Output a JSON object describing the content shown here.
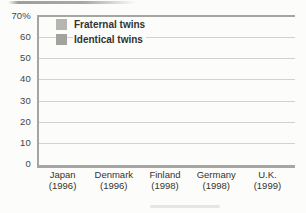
{
  "chart_data": {
    "type": "bar",
    "title": "",
    "xlabel": "",
    "ylabel": "",
    "ylim": [
      0,
      70
    ],
    "grid": true,
    "legend_position": "top-left",
    "axis_color": "#a5a5a1",
    "grid_color": "#d1d1cd",
    "yticks": [
      {
        "value": 70,
        "label": "70%"
      },
      {
        "value": 60,
        "label": "60"
      },
      {
        "value": 50,
        "label": "50"
      },
      {
        "value": 40,
        "label": "40"
      },
      {
        "value": 30,
        "label": "30"
      },
      {
        "value": 20,
        "label": "20"
      },
      {
        "value": 10,
        "label": "10"
      },
      {
        "value": 0,
        "label": "0"
      }
    ],
    "categories": [
      {
        "country": "Japan",
        "year": "(1996)"
      },
      {
        "country": "Denmark",
        "year": "(1996)"
      },
      {
        "country": "Finland",
        "year": "(1998)"
      },
      {
        "country": "Germany",
        "year": "(1998)"
      },
      {
        "country": "U.K.",
        "year": "(1999)"
      }
    ],
    "series": [
      {
        "name": "Fraternal twins",
        "color": "#b7b5b1",
        "values": [
          12,
          10,
          9,
          26,
          5
        ]
      },
      {
        "name": "Identical twins",
        "color": "#a4a29e",
        "values": [
          46,
          41,
          44,
          61,
          40
        ]
      }
    ]
  }
}
